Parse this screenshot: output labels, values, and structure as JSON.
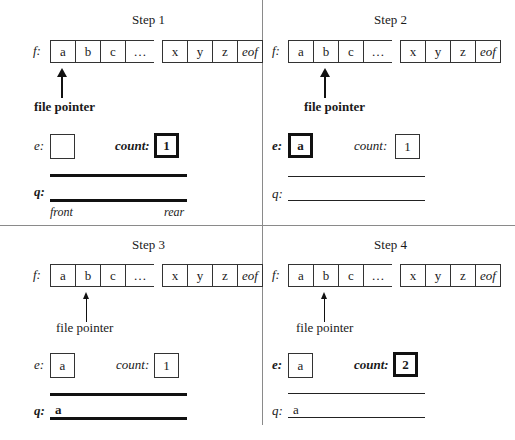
{
  "colors": {
    "line": "#333333",
    "divider": "#8a8a8a",
    "emphasis": "#111111"
  },
  "tape_cells_left": [
    "a",
    "b",
    "c"
  ],
  "tape_ellipsis": "…",
  "tape_cells_right": [
    "x",
    "y",
    "z",
    "eof"
  ],
  "labels": {
    "file": "f:",
    "element": "e:",
    "count": "count:",
    "queue": "q:",
    "file_pointer": "file pointer",
    "front": "front",
    "rear": "rear"
  },
  "steps": [
    {
      "title": "Step 1",
      "pointer_cell": "a",
      "pointer_bold": true,
      "e_value": "",
      "e_bold": false,
      "count_value": "1",
      "count_bold": true,
      "queue": "",
      "queue_bold": true,
      "show_front_rear": true
    },
    {
      "title": "Step 2",
      "pointer_cell": "b",
      "pointer_bold": true,
      "e_value": "a",
      "e_bold": true,
      "count_value": "1",
      "count_bold": false,
      "queue": "",
      "queue_bold": false,
      "show_front_rear": false
    },
    {
      "title": "Step 3",
      "pointer_cell": "b",
      "pointer_bold": false,
      "e_value": "a",
      "e_bold": false,
      "count_value": "1",
      "count_bold": false,
      "queue": "a",
      "queue_bold": true,
      "show_front_rear": false
    },
    {
      "title": "Step 4",
      "pointer_cell": "b",
      "pointer_bold": false,
      "e_value": "a",
      "e_bold": false,
      "count_value": "2",
      "count_bold": true,
      "queue": "a",
      "queue_bold": false,
      "show_front_rear": false
    }
  ]
}
